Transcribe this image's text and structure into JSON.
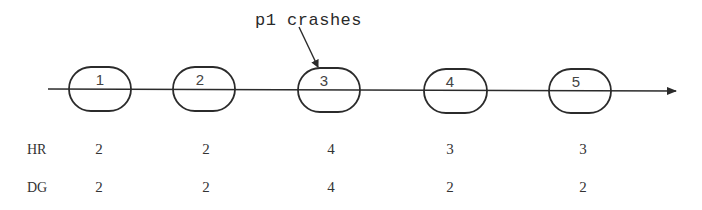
{
  "annotation": {
    "text": "p1 crashes",
    "points_to_round": 3
  },
  "timeline": {
    "rounds": [
      {
        "label": "1",
        "cx": 100
      },
      {
        "label": "2",
        "cx": 204
      },
      {
        "label": "3",
        "cx": 329
      },
      {
        "label": "4",
        "cx": 455
      },
      {
        "label": "5",
        "cx": 580
      }
    ]
  },
  "table": {
    "rows": [
      {
        "label": "HR",
        "values": [
          "2",
          "2",
          "4",
          "3",
          "3"
        ]
      },
      {
        "label": "DG",
        "values": [
          "2",
          "2",
          "4",
          "2",
          "2"
        ]
      }
    ]
  },
  "colors": {
    "stroke": "#2b2b2b",
    "text": "#333333",
    "background": "#ffffff"
  }
}
